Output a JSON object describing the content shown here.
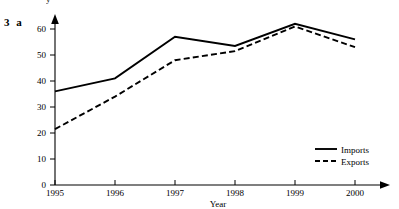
{
  "exercise": {
    "label": "3 a"
  },
  "clipped_header": {
    "text": "y"
  },
  "chart_data": {
    "type": "line",
    "title": "",
    "xlabel": "Year",
    "ylabel": "",
    "categories": [
      "1995",
      "1996",
      "1997",
      "1998",
      "1999",
      "2000"
    ],
    "x": [
      1995,
      1996,
      1997,
      1998,
      1999,
      2000
    ],
    "xlim": [
      1995,
      2000
    ],
    "ylim": [
      0,
      63
    ],
    "yticks": [
      0,
      10,
      20,
      30,
      40,
      50,
      60
    ],
    "ytick_labels": [
      "0",
      "10",
      "20",
      "30",
      "40",
      "50",
      "60"
    ],
    "xtick_labels": [
      "1995",
      "1996",
      "1997",
      "1998",
      "1999",
      "2000"
    ],
    "grid": false,
    "legend_position": "bottom-right",
    "series": [
      {
        "name": "Imports",
        "style": "solid",
        "color": "#000000",
        "values": [
          36,
          41,
          57,
          53.5,
          62,
          56
        ]
      },
      {
        "name": "Exports",
        "style": "dashed",
        "color": "#000000",
        "values": [
          21.5,
          34,
          48,
          51.5,
          61,
          53
        ]
      }
    ]
  },
  "legend": {
    "items": [
      {
        "label": "Imports",
        "style": "solid"
      },
      {
        "label": "Exports",
        "style": "dashed"
      }
    ]
  }
}
